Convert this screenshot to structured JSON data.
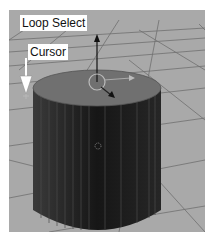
{
  "viewport": {
    "background": "#a9a9a9",
    "grid_color": "#6a6a6a",
    "object": "cylinder",
    "top_face_color": "#707070",
    "side_color": "#1e1e1e"
  },
  "annotations": {
    "loop_select": "Loop Select",
    "cursor": "Cursor"
  }
}
